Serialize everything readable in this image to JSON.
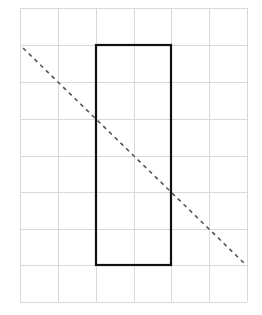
{
  "diagram": {
    "grid": {
      "columns": 6,
      "rows": 8,
      "x_lines": [
        20,
        58,
        96,
        134,
        171,
        209,
        247
      ],
      "y_lines": [
        8,
        45,
        82,
        119,
        156,
        192,
        229,
        265,
        302
      ],
      "color": "#d9d9d9"
    },
    "rectangle": {
      "x": 96,
      "y": 45,
      "width": 75,
      "height": 220,
      "grid_cells": "2 columns x 6 rows",
      "stroke": "#111111"
    },
    "diagonal_line": {
      "x1": 23,
      "y1": 48,
      "x2": 246,
      "y2": 265,
      "style": "dashed",
      "stroke": "#555555"
    }
  }
}
